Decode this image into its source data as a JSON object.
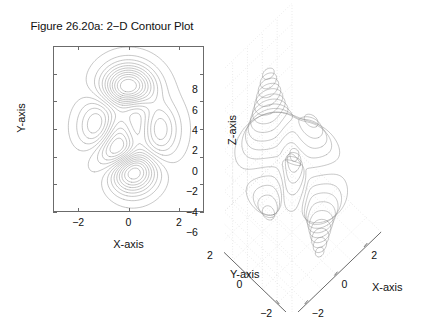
{
  "figure": {
    "background": "#ffffff",
    "line_color": "#8c8c8c",
    "axis_color": "#6b6b6b",
    "grid_color": "#bdbdbd",
    "text_color": "#111111"
  },
  "panel_2d": {
    "title": "Figure 26.20a: 2−D Contour Plot",
    "xlabel": "X-axis",
    "ylabel": "Y-axis",
    "xticks": [
      "−2",
      "0",
      "2"
    ],
    "yticks": [
      "3",
      "2",
      "1",
      "0",
      "−1",
      "−2",
      "−3"
    ]
  },
  "panel_3d": {
    "xlabel": "X-axis",
    "ylabel": "Y-axis",
    "zlabel": "Z-axis",
    "xticks": [
      "−2",
      "0",
      "2"
    ],
    "yticks": [
      "2",
      "0",
      "−2"
    ],
    "zticks": [
      "8",
      "6",
      "4",
      "2",
      "0",
      "−2",
      "−4",
      "−6"
    ]
  },
  "chart_data": {
    "type": "line",
    "title": "Figure 26.20a: 2−D Contour Plot",
    "subtitle": "",
    "plots": [
      {
        "id": "contour-2d",
        "kind": "contour",
        "title": "Figure 26.20a: 2−D Contour Plot",
        "xlabel": "X-axis",
        "ylabel": "Y-axis",
        "xlim": [
          -3,
          3
        ],
        "ylim": [
          -3,
          3
        ],
        "xticks": [
          -2,
          0,
          2
        ],
        "yticks": [
          -3,
          -2,
          -1,
          0,
          1,
          2,
          3
        ],
        "grid": false,
        "legend": "none",
        "surface": "peaks",
        "n_levels": 20,
        "zlim": [
          -6.5,
          8.1
        ],
        "levels": [
          -6.0,
          -5.3,
          -4.6,
          -3.9,
          -3.2,
          -2.5,
          -1.8,
          -1.1,
          -0.4,
          0.3,
          1.0,
          1.7,
          2.4,
          3.1,
          3.8,
          4.5,
          5.2,
          5.9,
          6.6,
          7.3
        ],
        "features": [
          {
            "name": "global-maximum",
            "x": 0.23,
            "y": 1.58,
            "z": 8.11
          },
          {
            "name": "global-minimum",
            "x": 0.23,
            "y": -1.63,
            "z": -6.55
          },
          {
            "name": "local-maximum",
            "x": -1.35,
            "y": 0.2,
            "z": 3.78
          },
          {
            "name": "local-minimum",
            "x": -0.46,
            "y": -0.63,
            "z": -3.05
          },
          {
            "name": "local-maximum-right",
            "x": 1.33,
            "y": -0.01,
            "z": 0.6
          }
        ]
      },
      {
        "id": "contour-3d",
        "kind": "contour3",
        "title": "",
        "xlabel": "X-axis",
        "ylabel": "Y-axis",
        "zlabel": "Z-axis",
        "xlim": [
          -3,
          3
        ],
        "ylim": [
          -3,
          3
        ],
        "zlim": [
          -6,
          8
        ],
        "xticks": [
          -2,
          0,
          2
        ],
        "yticks": [
          -2,
          0,
          2
        ],
        "zticks": [
          -6,
          -4,
          -2,
          0,
          2,
          4,
          6,
          8
        ],
        "grid": true,
        "legend": "none",
        "surface": "peaks",
        "n_levels": 20,
        "view_azimuth": -37.5,
        "view_elevation": 30
      }
    ]
  }
}
